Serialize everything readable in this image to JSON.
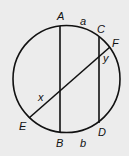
{
  "diagram": {
    "points": {
      "A": "A",
      "B": "B",
      "C": "C",
      "D": "D",
      "E": "E",
      "F": "F"
    },
    "arcs": {
      "a": "a",
      "b": "b"
    },
    "angles": {
      "x": "x",
      "y": "y"
    },
    "background": "#ececec",
    "stroke": "#111111"
  }
}
